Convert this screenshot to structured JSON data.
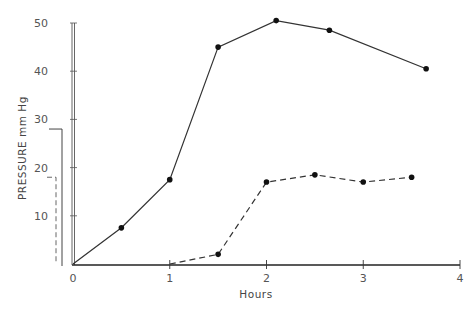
{
  "chart_data": {
    "type": "line",
    "title": "",
    "xlabel": "Hours",
    "ylabel": "PRESSURE   mm Hg",
    "xlim": [
      0,
      4
    ],
    "ylim": [
      0,
      50
    ],
    "x_ticks": [
      0,
      1,
      2,
      3,
      4
    ],
    "x_tick_labels": [
      "0",
      "1",
      "2",
      "3",
      "4"
    ],
    "y_ticks": [
      10,
      20,
      30,
      40,
      50
    ],
    "y_tick_labels": [
      "10",
      "20",
      "30",
      "40",
      "50"
    ],
    "grid": false,
    "legend": "brackets left of y-axis (solid line bracket, dashed line bracket), unlabeled",
    "series": [
      {
        "name": "solid",
        "style": "solid",
        "x": [
          0,
          0.5,
          1.0,
          1.5,
          2.1,
          2.65,
          3.65
        ],
        "y": [
          0,
          7.5,
          17.5,
          45,
          50.5,
          48.5,
          40.5
        ],
        "markers_at_index_from": 1
      },
      {
        "name": "dashed",
        "style": "dashed",
        "x": [
          1.0,
          1.5,
          2.0,
          2.5,
          3.0,
          3.5
        ],
        "y": [
          0,
          2,
          17,
          18.5,
          17,
          18
        ],
        "markers_at_index_from": 1
      }
    ],
    "legend_brackets": [
      {
        "style": "solid",
        "top_value": 28
      },
      {
        "style": "dashed",
        "top_value": 18
      }
    ]
  }
}
